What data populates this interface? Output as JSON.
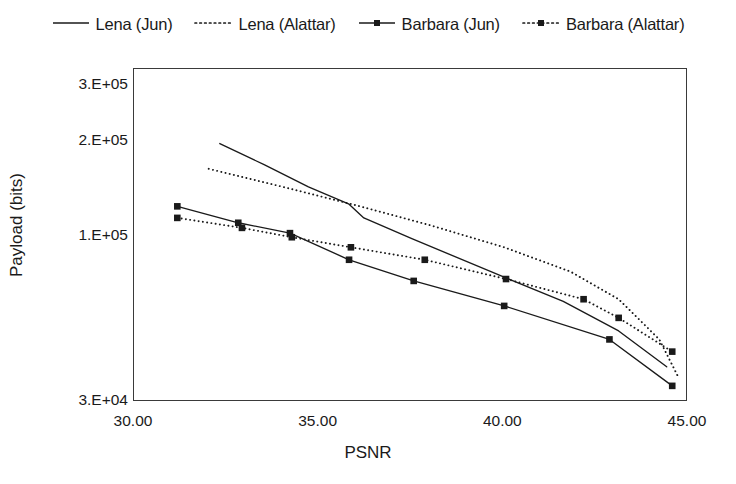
{
  "chart_data": {
    "type": "line",
    "title": "",
    "xlabel": "PSNR",
    "ylabel": "Payload (bits)",
    "xlim": [
      30.0,
      45.0
    ],
    "ylim": [
      30000,
      340000
    ],
    "yscale": "log",
    "grid": false,
    "legend_position": "top",
    "x_ticks": [
      "30.00",
      "35.00",
      "40.00",
      "45.00"
    ],
    "x_tick_values": [
      30.0,
      35.0,
      40.0,
      45.0
    ],
    "y_ticks": [
      "3.E+04",
      "1.E+05",
      "2.E+05",
      "3.E+05"
    ],
    "y_tick_values": [
      30000,
      100000,
      200000,
      300000
    ],
    "series": [
      {
        "name": "Lena (Jun)",
        "style": "solid",
        "marker": "none",
        "color": "#1a1a1a",
        "points": [
          [
            32.35,
            196000
          ],
          [
            33.55,
            168000
          ],
          [
            34.75,
            143000
          ],
          [
            35.85,
            126000
          ],
          [
            36.25,
            114000
          ],
          [
            37.55,
            98000
          ],
          [
            40.05,
            74000
          ],
          [
            41.65,
            62000
          ],
          [
            43.15,
            50000
          ],
          [
            44.45,
            38500
          ]
        ]
      },
      {
        "name": "Lena (Alattar)",
        "style": "dotted",
        "marker": "none",
        "color": "#1a1a1a",
        "points": [
          [
            32.05,
            163000
          ],
          [
            34.05,
            143000
          ],
          [
            36.15,
            124000
          ],
          [
            38.05,
            108000
          ],
          [
            40.05,
            92000
          ],
          [
            41.85,
            77000
          ],
          [
            43.15,
            63000
          ],
          [
            44.25,
            47000
          ],
          [
            44.75,
            36000
          ]
        ]
      },
      {
        "name": "Barbara (Jun)",
        "style": "solid",
        "marker": "square",
        "color": "#1a1a1a",
        "points": [
          [
            31.2,
            124000
          ],
          [
            32.85,
            110000
          ],
          [
            34.25,
            102000
          ],
          [
            35.85,
            84000
          ],
          [
            37.6,
            72000
          ],
          [
            40.05,
            60000
          ],
          [
            42.9,
            47000
          ],
          [
            44.6,
            33500
          ]
        ]
      },
      {
        "name": "Barbara (Alattar)",
        "style": "dotted",
        "marker": "square",
        "color": "#1a1a1a",
        "points": [
          [
            31.2,
            114000
          ],
          [
            32.95,
            106000
          ],
          [
            34.3,
            99000
          ],
          [
            35.9,
            92000
          ],
          [
            37.9,
            84000
          ],
          [
            40.1,
            73000
          ],
          [
            42.2,
            63000
          ],
          [
            43.15,
            55000
          ],
          [
            44.6,
            43000
          ]
        ]
      }
    ]
  },
  "legend": {
    "items": [
      {
        "label": "Lena (Jun)",
        "style": "solid",
        "marker": "none"
      },
      {
        "label": "Lena (Alattar)",
        "style": "dotted",
        "marker": "none"
      },
      {
        "label": "Barbara (Jun)",
        "style": "solid",
        "marker": "square"
      },
      {
        "label": "Barbara (Alattar)",
        "style": "dotted",
        "marker": "square"
      }
    ]
  },
  "axes": {
    "x_title": "PSNR",
    "y_title": "Payload (bits)"
  }
}
